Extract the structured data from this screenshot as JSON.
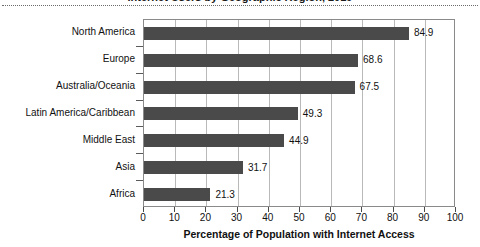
{
  "figure": {
    "title_remnant": "Internet Users by Geographic Region, 2019",
    "background_color": "#ffffff"
  },
  "chart_data": {
    "type": "bar",
    "orientation": "horizontal",
    "title": "",
    "xlabel": "Percentage of Population with Internet Access",
    "ylabel": "",
    "categories": [
      "North America",
      "Europe",
      "Australia/Oceania",
      "Latin America/Caribbean",
      "Middle East",
      "Asia",
      "Africa"
    ],
    "values": [
      84.9,
      68.6,
      67.5,
      49.3,
      44.9,
      31.7,
      21.3
    ],
    "value_labels": [
      "84.9",
      "68.6",
      "67.5",
      "49.3",
      "44.9",
      "31.7",
      "21.3"
    ],
    "xlim": [
      0,
      100
    ],
    "xticks": [
      0,
      10,
      20,
      30,
      40,
      50,
      60,
      70,
      80,
      90,
      100
    ],
    "xtick_labels": [
      "0",
      "10",
      "20",
      "30",
      "40",
      "50",
      "60",
      "70",
      "80",
      "90",
      "100"
    ],
    "grid": "vertical",
    "legend": null,
    "bar_color": "#4a4a4a",
    "grid_color": "#b9b9b9",
    "axis_color": "#8a8a8a"
  }
}
